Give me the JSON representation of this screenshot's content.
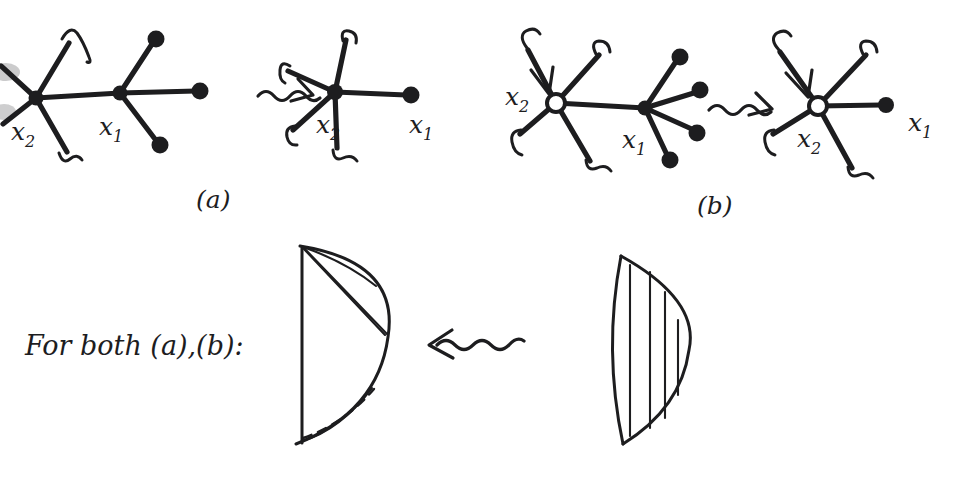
{
  "figure": {
    "background_color": "#ffffff",
    "ink_color": "#1d1d1f",
    "smudge_color": "#b9b9bb",
    "medium": "hand-drawn pen sketch",
    "caption_text": "For both (a),(b):"
  },
  "panels": [
    {
      "id": "panel-a",
      "label": "(a)",
      "label_position": {
        "x": 196,
        "y": 208
      },
      "description": "Tree with vertices x2 and x1 joined by an edge; contracting the edge merges them into a single 5-valent vertex labelled x2 with x1 becoming a leaf.",
      "before": {
        "name": "tree-before-a",
        "vertices": [
          {
            "name": "x2",
            "label": "x₂",
            "label_main": "x",
            "label_sub": "2",
            "x": 36,
            "y": 98,
            "style": "solid",
            "label_x": 11,
            "label_y": 140
          },
          {
            "name": "x1",
            "label": "x₁",
            "label_main": "x",
            "label_sub": "1",
            "x": 120,
            "y": 93,
            "style": "solid",
            "label_x": 99,
            "label_y": 135
          }
        ],
        "legs": [
          {
            "from": "x2",
            "to_x": 1,
            "to_y": 66,
            "terminal": "hook"
          },
          {
            "from": "x2",
            "to_x": 3,
            "to_y": 124,
            "terminal": "hook"
          },
          {
            "from": "x2",
            "to_x": 68,
            "to_y": 44,
            "terminal": "hook"
          },
          {
            "from": "x2",
            "to_x": 66,
            "to_y": 152,
            "terminal": "hook"
          },
          {
            "from": "x1",
            "to_x": 156,
            "to_y": 40,
            "terminal": "dot"
          },
          {
            "from": "x1",
            "to_x": 200,
            "to_y": 91,
            "terminal": "dot"
          },
          {
            "from": "x1",
            "to_x": 160,
            "to_y": 144,
            "terminal": "dot"
          }
        ],
        "spine": {
          "from": "x2",
          "to": "x1"
        }
      },
      "arrow": {
        "name": "squiggle-arrow-a",
        "direction": "right",
        "x": 262,
        "y": 90
      },
      "after": {
        "name": "tree-after-a",
        "vertices": [
          {
            "name": "x2",
            "label": "x₂",
            "label_main": "x",
            "label_sub": "2",
            "x": 335,
            "y": 92,
            "style": "solid",
            "label_x": 316,
            "label_y": 133
          },
          {
            "name": "x1",
            "label": "x₁",
            "label_main": "x",
            "label_sub": "1",
            "x": 410,
            "y": 95,
            "style": "leaf-dot",
            "label_x": 409,
            "label_y": 133
          }
        ],
        "legs": [
          {
            "from": "x2",
            "to_x": 286,
            "to_y": 70,
            "terminal": "hook"
          },
          {
            "from": "x2",
            "to_x": 292,
            "to_y": 131,
            "terminal": "hook"
          },
          {
            "from": "x2",
            "to_x": 345,
            "to_y": 38,
            "terminal": "hook"
          },
          {
            "from": "x2",
            "to_x": 336,
            "to_y": 150,
            "terminal": "hook"
          },
          {
            "from": "x2",
            "to_x": 410,
            "to_y": 95,
            "terminal": "dot"
          }
        ]
      }
    },
    {
      "id": "panel-b",
      "label": "(b)",
      "label_position": {
        "x": 697,
        "y": 214
      },
      "description": "Same contraction but x2 is an open (hollow) vertex with an incoming arrow on one leg; x1 carries four leaves.",
      "before": {
        "name": "tree-before-b",
        "vertices": [
          {
            "name": "x2",
            "label": "x₂",
            "label_main": "x",
            "label_sub": "2",
            "x": 556,
            "y": 103,
            "style": "open",
            "label_x": 505,
            "label_y": 105
          },
          {
            "name": "x1",
            "label": "x₁",
            "label_main": "x",
            "label_sub": "1",
            "x": 645,
            "y": 108,
            "style": "solid",
            "label_x": 622,
            "label_y": 148
          }
        ],
        "legs": [
          {
            "from": "x2",
            "to_x": 529,
            "to_y": 48,
            "terminal": "hook",
            "marked": true
          },
          {
            "from": "x2",
            "to_x": 519,
            "to_y": 136,
            "terminal": "hook"
          },
          {
            "from": "x2",
            "to_x": 600,
            "to_y": 53,
            "terminal": "hook"
          },
          {
            "from": "x2",
            "to_x": 590,
            "to_y": 163,
            "terminal": "hook"
          },
          {
            "from": "x1",
            "to_x": 680,
            "to_y": 58,
            "terminal": "dot"
          },
          {
            "from": "x1",
            "to_x": 700,
            "to_y": 90,
            "terminal": "dot"
          },
          {
            "from": "x1",
            "to_x": 697,
            "to_y": 132,
            "terminal": "dot"
          },
          {
            "from": "x1",
            "to_x": 670,
            "to_y": 160,
            "terminal": "dot"
          }
        ],
        "spine": {
          "from": "x2",
          "to": "x1"
        }
      },
      "arrow": {
        "name": "squiggle-arrow-b",
        "direction": "right",
        "x": 712,
        "y": 103
      },
      "after": {
        "name": "tree-after-b",
        "vertices": [
          {
            "name": "x2",
            "label": "x₂",
            "label_main": "x",
            "label_sub": "2",
            "x": 818,
            "y": 106,
            "style": "open",
            "label_x": 797,
            "label_y": 147
          },
          {
            "name": "x1",
            "label": "x₁",
            "label_main": "x",
            "label_sub": "1",
            "x": 885,
            "y": 105,
            "style": "leaf-dot",
            "label_x": 908,
            "label_y": 131
          }
        ],
        "legs": [
          {
            "from": "x2",
            "to_x": 779,
            "to_y": 50,
            "terminal": "hook",
            "marked": true
          },
          {
            "from": "x2",
            "to_x": 772,
            "to_y": 136,
            "terminal": "hook"
          },
          {
            "from": "x2",
            "to_x": 867,
            "to_y": 53,
            "terminal": "hook"
          },
          {
            "from": "x2",
            "to_x": 852,
            "to_y": 170,
            "terminal": "hook"
          },
          {
            "from": "x2",
            "to_x": 885,
            "to_y": 105,
            "terminal": "dot"
          }
        ]
      }
    }
  ],
  "bottom": {
    "name": "disk-row",
    "caption": "For both (a),(b):",
    "caption_position": {
      "x": 25,
      "y": 355
    },
    "arrow": {
      "name": "squiggle-arrow-bottom",
      "direction": "left",
      "x": 430,
      "y": 343
    },
    "left_disk": {
      "name": "fan-triangulated-disk",
      "description": "Half-disk with diagonal chords fanning from the top-left corner plus one dashed chord near the bottom",
      "chord_count": 4,
      "chord_style": "fan from top vertex",
      "has_dashed_chord": true
    },
    "right_disk": {
      "name": "parallel-chord-disk",
      "description": "Half-disk with four vertical parallel chords",
      "chord_count": 4,
      "chord_style": "parallel vertical",
      "has_dashed_chord": false
    }
  }
}
